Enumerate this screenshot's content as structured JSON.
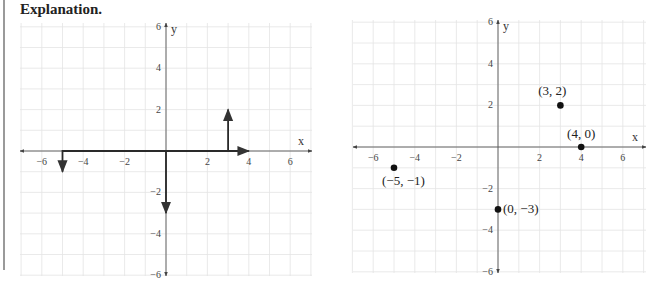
{
  "heading": "Explanation.",
  "chart_data": [
    {
      "type": "line",
      "title": "",
      "xlabel": "x",
      "ylabel": "y",
      "xlim": [
        -7,
        7
      ],
      "ylim": [
        -7,
        7
      ],
      "grid": true,
      "xticks": [
        "−6",
        "−4",
        "−2",
        "2",
        "4",
        "6"
      ],
      "yticks": [
        "6",
        "4",
        "2",
        "−2",
        "−4",
        "−6"
      ],
      "series": [
        {
          "name": "to (3,2)",
          "points": [
            [
              0,
              0
            ],
            [
              3,
              0
            ],
            [
              3,
              2
            ]
          ]
        },
        {
          "name": "to (4,0)",
          "points": [
            [
              0,
              0
            ],
            [
              4,
              0
            ]
          ]
        },
        {
          "name": "to (-5,-1)",
          "points": [
            [
              0,
              0
            ],
            [
              -5,
              0
            ],
            [
              -5,
              -1
            ]
          ]
        },
        {
          "name": "to (0,-3)",
          "points": [
            [
              0,
              0
            ],
            [
              0,
              -3
            ]
          ]
        }
      ]
    },
    {
      "type": "scatter",
      "title": "",
      "xlabel": "x",
      "ylabel": "y",
      "xlim": [
        -7,
        7
      ],
      "ylim": [
        -7,
        7
      ],
      "grid": true,
      "xticks": [
        "−6",
        "−4",
        "−2",
        "2",
        "4",
        "6"
      ],
      "yticks": [
        "6",
        "4",
        "2",
        "−2",
        "−4",
        "−6"
      ],
      "points": [
        {
          "x": 3,
          "y": 2,
          "label": "(3, 2)"
        },
        {
          "x": 4,
          "y": 0,
          "label": "(4, 0)"
        },
        {
          "x": -5,
          "y": -1,
          "label": "(−5, −1)"
        },
        {
          "x": 0,
          "y": -3,
          "label": "(0, −3)"
        }
      ]
    }
  ]
}
